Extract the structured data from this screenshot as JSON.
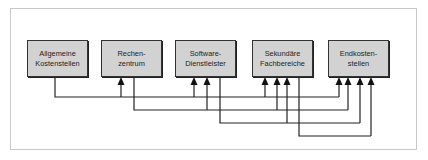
{
  "diagram": {
    "boxes": [
      {
        "id": "allgemeine-kostenstellen",
        "label": "Allgemeine\nKostenstellen",
        "x": 27
      },
      {
        "id": "rechenzentrum",
        "label": "Rechen-\nzentrum",
        "x": 101
      },
      {
        "id": "software-dienstleister",
        "label": "Software-\nDienstleister",
        "x": 175
      },
      {
        "id": "sekundaere-fachbereiche",
        "label": "Sekundäre\nFachbereiche",
        "x": 252
      },
      {
        "id": "endkostenstellen",
        "label": "Endkosten-\nstellen",
        "x": 328
      }
    ],
    "flows": [
      {
        "from": "Allgemeine Kostenstellen",
        "to": [
          "Rechenzentrum",
          "Software-Dienstleister",
          "Sekundäre Fachbereiche",
          "Endkostenstellen"
        ]
      },
      {
        "from": "Rechenzentrum",
        "to": [
          "Software-Dienstleister",
          "Sekundäre Fachbereiche",
          "Endkostenstellen"
        ]
      },
      {
        "from": "Software-Dienstleister",
        "to": [
          "Sekundäre Fachbereiche",
          "Endkostenstellen"
        ]
      },
      {
        "from": "Sekundäre Fachbereiche",
        "to": [
          "Endkostenstellen"
        ]
      }
    ],
    "colors": {
      "box_fill": "#d2d2d2",
      "line": "#222222",
      "frame": "#c8c8c8"
    }
  }
}
